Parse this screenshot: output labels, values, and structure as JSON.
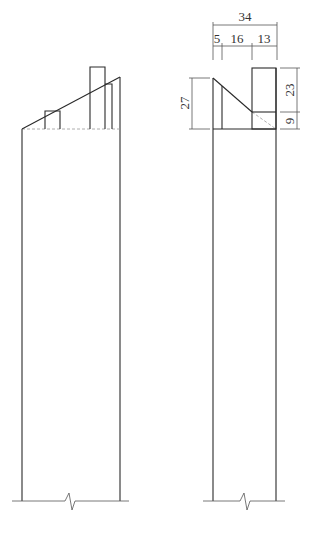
{
  "drawing": {
    "type": "engineering-elevation",
    "views": [
      {
        "name": "front-view",
        "description": "Wall with sloped cap and two protrusions"
      },
      {
        "name": "side-view",
        "description": "Wall side profile with dimensions"
      }
    ],
    "dimensions": {
      "overall_width": "34",
      "segment_1": "5",
      "segment_2": "16",
      "segment_3": "13",
      "left_height": "27",
      "upper_height": "23",
      "lower_height": "9"
    },
    "colors": {
      "line": "#2a2a2a",
      "text": "#333333",
      "background": "#ffffff"
    }
  }
}
